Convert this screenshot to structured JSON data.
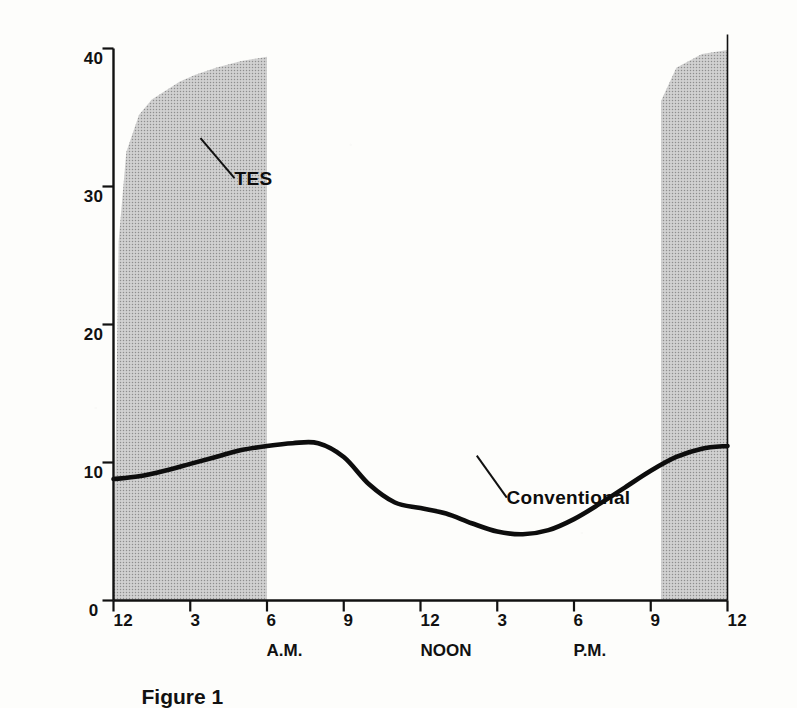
{
  "figure": {
    "caption": "Figure 1"
  },
  "colors": {
    "ink": "#111111",
    "tes_fill": "#9a9a9a",
    "conventional_line": "#0d0d0d",
    "paper": "#fdfdfb"
  },
  "chart_data": {
    "type": "area",
    "title": "",
    "subtitle": "",
    "orientation": "rotated-90-clockwise",
    "xlabel": "",
    "ylabel": "",
    "xlim": [
      0,
      24
    ],
    "ylim": [
      0,
      40
    ],
    "grid": false,
    "legend": "none (in-plot annotations)",
    "x_tick_labels": [
      "12",
      "3",
      "6",
      "9",
      "12",
      "3",
      "6",
      "9",
      "12"
    ],
    "x_tick_values": [
      0,
      3,
      6,
      9,
      12,
      15,
      18,
      21,
      24
    ],
    "x_group_labels": [
      {
        "label": "A.M.",
        "at": 6
      },
      {
        "label": "NOON",
        "at": 12
      },
      {
        "label": "P.M.",
        "at": 18
      }
    ],
    "y_tick_labels": [
      "0",
      "10",
      "20",
      "30",
      "40"
    ],
    "y_tick_values": [
      0,
      10,
      20,
      30,
      40
    ],
    "annotations": [
      {
        "text": "TES",
        "at_x": 3.4,
        "at_y": 33.5
      },
      {
        "text": "Conventional",
        "at_x": 14.2,
        "at_y": 10.5
      }
    ],
    "series": [
      {
        "name": "TES",
        "type": "area",
        "fill": "#9a9a9a",
        "x": [
          0,
          0.2,
          0.5,
          1,
          1.5,
          2,
          2.6,
          3.2,
          4,
          5,
          6,
          6.001,
          21.4,
          21.401,
          22,
          23,
          24
        ],
        "values": [
          0,
          26,
          32.5,
          35.2,
          36.3,
          36.9,
          37.6,
          38.1,
          38.6,
          39.1,
          39.4,
          0,
          0,
          36.2,
          38.6,
          39.6,
          39.9
        ]
      },
      {
        "name": "Conventional",
        "type": "line",
        "stroke": "#0d0d0d",
        "x": [
          0,
          1,
          2,
          3,
          4,
          5,
          6,
          7,
          8,
          9,
          10,
          11,
          12,
          13,
          14,
          15,
          16,
          17,
          18,
          19,
          20,
          21,
          22,
          23,
          24
        ],
        "values": [
          8.8,
          9.0,
          9.4,
          9.9,
          10.4,
          10.9,
          11.2,
          11.4,
          11.4,
          10.4,
          8.4,
          7.1,
          6.7,
          6.3,
          5.6,
          5.0,
          4.8,
          5.1,
          5.9,
          7.0,
          8.2,
          9.4,
          10.4,
          11.0,
          11.2
        ]
      }
    ]
  }
}
